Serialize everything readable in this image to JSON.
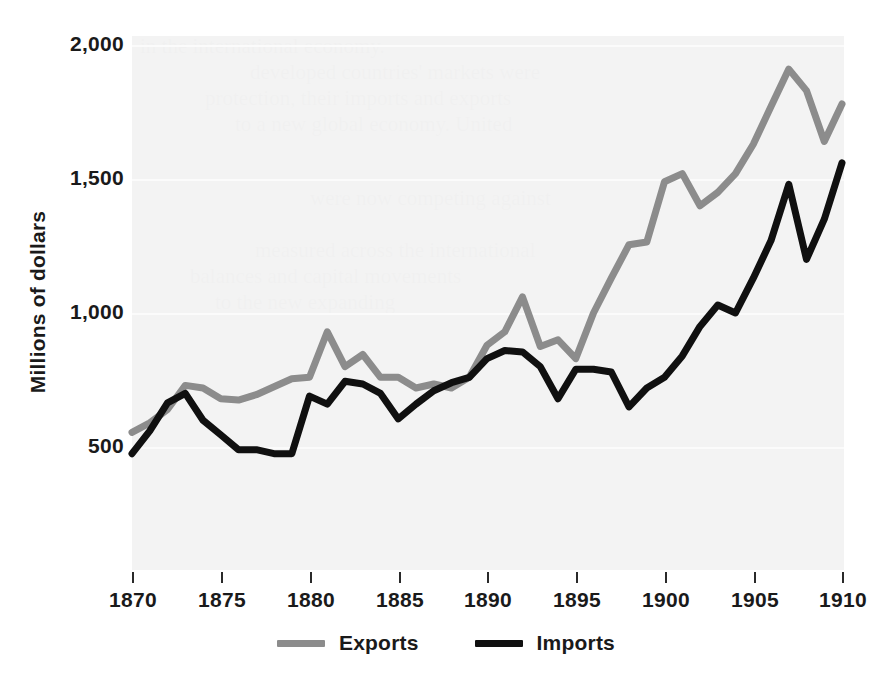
{
  "chart_data": {
    "type": "line",
    "title": "",
    "xlabel": "",
    "ylabel": "Millions of dollars",
    "xlim": [
      1870,
      1910
    ],
    "ylim": [
      350,
      2000
    ],
    "grid": true,
    "legend_position": "bottom-center",
    "xticks": [
      1870,
      1875,
      1880,
      1885,
      1890,
      1895,
      1900,
      1905,
      1910
    ],
    "xtick_labels": [
      "1870",
      "1875",
      "1880",
      "1885",
      "1890",
      "1895",
      "1900",
      "1905",
      "1910"
    ],
    "yticks": [
      500,
      1000,
      1500,
      2000
    ],
    "ytick_labels": [
      "500",
      "1,000",
      "1,500",
      "2,000"
    ],
    "x": [
      1870,
      1871,
      1872,
      1873,
      1874,
      1875,
      1876,
      1877,
      1878,
      1879,
      1880,
      1881,
      1882,
      1883,
      1884,
      1885,
      1886,
      1887,
      1888,
      1889,
      1890,
      1891,
      1892,
      1893,
      1894,
      1895,
      1896,
      1897,
      1898,
      1899,
      1900,
      1901,
      1902,
      1903,
      1904,
      1905,
      1906,
      1907,
      1908,
      1909,
      1910
    ],
    "series": [
      {
        "name": "Exports",
        "color": "#8c8c8c",
        "values": [
          555,
          590,
          640,
          730,
          720,
          680,
          675,
          695,
          725,
          755,
          760,
          930,
          800,
          845,
          760,
          760,
          720,
          735,
          720,
          760,
          880,
          930,
          1060,
          875,
          900,
          830,
          1000,
          1130,
          1255,
          1265,
          1490,
          1520,
          1400,
          1450,
          1520,
          1630,
          1770,
          1910,
          1830,
          1640,
          1780
        ]
      },
      {
        "name": "Imports",
        "color": "#101010",
        "values": [
          475,
          560,
          665,
          700,
          600,
          545,
          490,
          490,
          475,
          475,
          690,
          660,
          745,
          735,
          700,
          605,
          660,
          710,
          740,
          760,
          830,
          860,
          855,
          800,
          680,
          790,
          790,
          780,
          650,
          720,
          760,
          840,
          950,
          1030,
          1000,
          1130,
          1270,
          1480,
          1200,
          1350,
          1560
        ]
      }
    ]
  },
  "legend": {
    "items": [
      {
        "label": "Exports",
        "color": "#8c8c8c"
      },
      {
        "label": "Imports",
        "color": "#101010"
      }
    ]
  },
  "background_text": {
    "lines": [
      "in the international economy.",
      "developed countries' markets were",
      "protection, their imports and exports",
      "to a new global economy. United",
      "were now competing against",
      "measured across the international",
      "balances and capital movements",
      "to the new expanding"
    ]
  }
}
